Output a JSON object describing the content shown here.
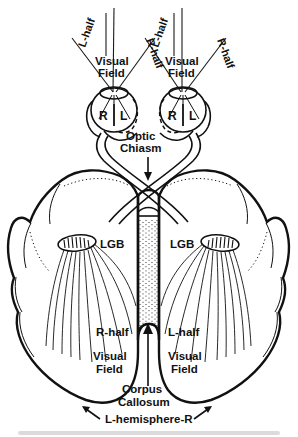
{
  "figure": {
    "width": 298,
    "height": 437,
    "background_color": "#ffffff",
    "ink_color": "#111111"
  },
  "top_field_labels": {
    "left_eye": {
      "outer_half": "L-half",
      "inner_half": "R-half",
      "field_line1": "Visual",
      "field_line2": "Field"
    },
    "right_eye": {
      "outer_half": "L-half",
      "inner_half": "R-half",
      "field_line1": "Visual",
      "field_line2": "Field"
    }
  },
  "eyes": {
    "left": {
      "nasal_label": "R",
      "temporal_label": "L"
    },
    "right": {
      "nasal_label": "R",
      "temporal_label": "L"
    }
  },
  "chiasm": {
    "line1": "Optic",
    "line2": "Chiasm"
  },
  "lgb": {
    "left_label": "LGB",
    "right_label": "LGB"
  },
  "cortex_field_labels": {
    "left_hemisphere": {
      "half": "R-half",
      "field_line1": "Visual",
      "field_line2": "Field"
    },
    "right_hemisphere": {
      "half": "L-half",
      "field_line1": "Visual",
      "field_line2": "Field"
    }
  },
  "corpus_callosum": {
    "line1": "Corpus",
    "line2": "Callosum"
  },
  "hemisphere_label": "L-hemisphere-R"
}
